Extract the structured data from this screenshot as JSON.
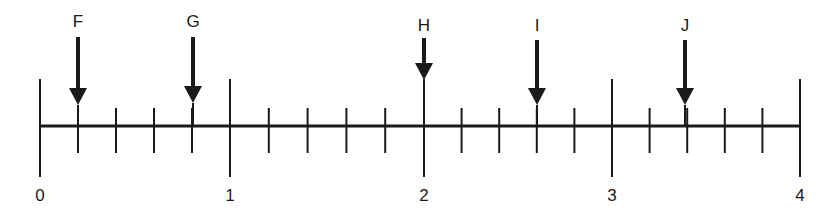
{
  "diagram": {
    "type": "number-line",
    "range": [
      0,
      4
    ],
    "major_ticks": [
      {
        "value": 0,
        "label": "0",
        "x": 40
      },
      {
        "value": 1,
        "label": "1",
        "x": 230
      },
      {
        "value": 2,
        "label": "2",
        "x": 424
      },
      {
        "value": 3,
        "label": "3",
        "x": 612
      },
      {
        "value": 4,
        "label": "4",
        "x": 800
      }
    ],
    "minor_step": 0.2,
    "markers": [
      {
        "label": "F",
        "value": 0.2,
        "x": 78,
        "label_top": 12,
        "shaft_top": 37,
        "tip": 105
      },
      {
        "label": "G",
        "value": 0.8,
        "x": 193,
        "label_top": 12,
        "shaft_top": 37,
        "tip": 103
      },
      {
        "label": "H",
        "value": 2.0,
        "x": 424,
        "label_top": 16,
        "shaft_top": 38,
        "tip": 80
      },
      {
        "label": "I",
        "value": 2.6,
        "x": 537,
        "label_top": 16,
        "shaft_top": 40,
        "tip": 105
      },
      {
        "label": "J",
        "value": 3.4,
        "x": 685,
        "label_top": 16,
        "shaft_top": 40,
        "tip": 105
      }
    ],
    "colors": {
      "ink": "#1a1a1a",
      "background": "#ffffff"
    }
  }
}
